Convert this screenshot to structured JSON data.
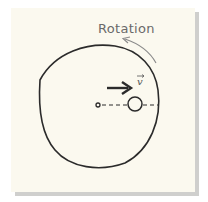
{
  "diagram": {
    "rotation_label": "Rotation",
    "velocity_label": "v",
    "colors": {
      "background": "#fbf9ef",
      "shadow": "#cfcfcd",
      "stroke": "#2b2b2b",
      "rotation_arrow": "#8a8a8a"
    },
    "elements": [
      "disk-outline",
      "center-point",
      "radial-dashed-line",
      "ball",
      "velocity-arrow",
      "rotation-arrow"
    ]
  }
}
